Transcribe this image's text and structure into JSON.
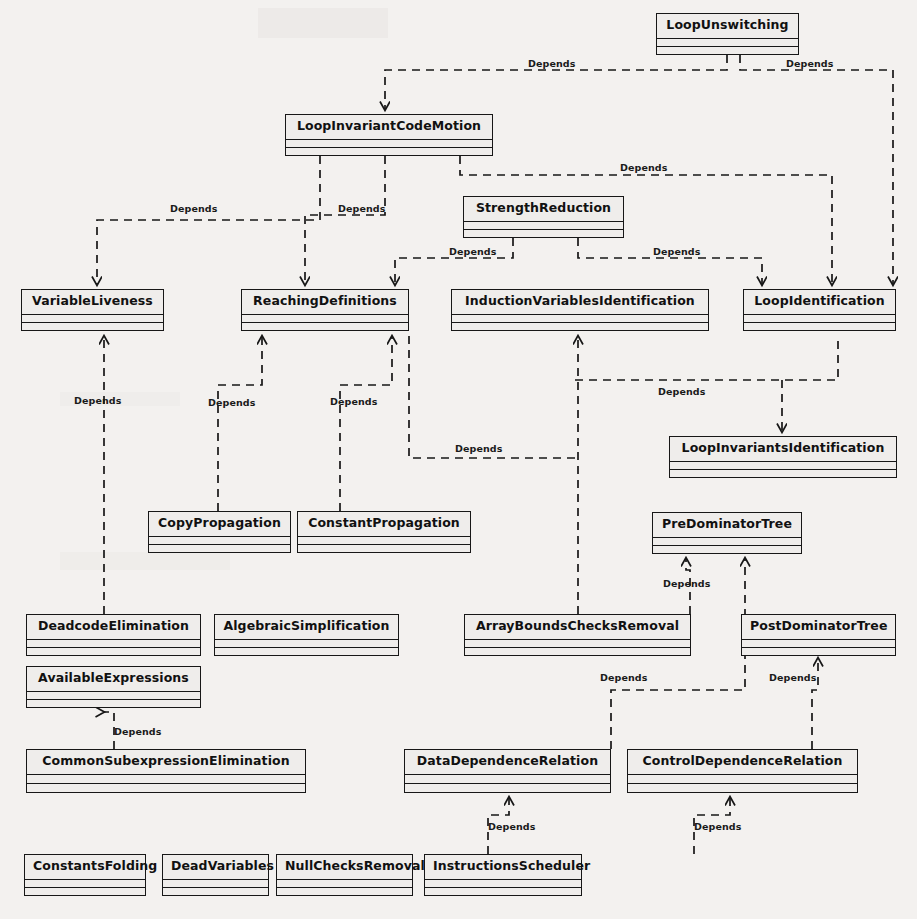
{
  "diagram": {
    "kind": "uml-class-dependency-diagram",
    "stereotype_label": "Depends",
    "colors": {
      "page_background": "#f3f1ef",
      "box_fill": "#efedeb",
      "line": "#171717",
      "text": "#111111"
    }
  },
  "classes": [
    {
      "id": "loop-unswitching",
      "name": "LoopUnswitching",
      "x": 656,
      "y": 13,
      "w": 143,
      "h": 42
    },
    {
      "id": "loop-invariant-code-motion",
      "name": "LoopInvariantCodeMotion",
      "x": 285,
      "y": 114,
      "w": 208,
      "h": 42
    },
    {
      "id": "strength-reduction",
      "name": "StrengthReduction",
      "x": 463,
      "y": 196,
      "w": 161,
      "h": 42
    },
    {
      "id": "variable-liveness",
      "name": "VariableLiveness",
      "x": 21,
      "y": 289,
      "w": 143,
      "h": 42
    },
    {
      "id": "reaching-definitions",
      "name": "ReachingDefinitions",
      "x": 241,
      "y": 289,
      "w": 168,
      "h": 42
    },
    {
      "id": "induction-variables-identification",
      "name": "InductionVariablesIdentification",
      "x": 451,
      "y": 289,
      "w": 258,
      "h": 42
    },
    {
      "id": "loop-identification",
      "name": "LoopIdentification",
      "x": 743,
      "y": 289,
      "w": 153,
      "h": 42
    },
    {
      "id": "loop-invariants-identification",
      "name": "LoopInvariantsIdentification",
      "x": 669,
      "y": 436,
      "w": 228,
      "h": 42
    },
    {
      "id": "copy-propagation",
      "name": "CopyPropagation",
      "x": 148,
      "y": 511,
      "w": 143,
      "h": 42
    },
    {
      "id": "constant-propagation",
      "name": "ConstantPropagation",
      "x": 297,
      "y": 511,
      "w": 174,
      "h": 42
    },
    {
      "id": "pre-dominator-tree",
      "name": "PreDominatorTree",
      "x": 652,
      "y": 512,
      "w": 150,
      "h": 42
    },
    {
      "id": "deadcode-elimination",
      "name": "DeadcodeElimination",
      "x": 26,
      "y": 614,
      "w": 175,
      "h": 42
    },
    {
      "id": "algebraic-simplification",
      "name": "AlgebraicSimplification",
      "x": 214,
      "y": 614,
      "w": 185,
      "h": 42
    },
    {
      "id": "array-bounds-checks-removal",
      "name": "ArrayBoundsChecksRemoval",
      "x": 464,
      "y": 614,
      "w": 227,
      "h": 42
    },
    {
      "id": "post-dominator-tree",
      "name": "PostDominatorTree",
      "x": 741,
      "y": 614,
      "w": 155,
      "h": 42
    },
    {
      "id": "available-expressions",
      "name": "AvailableExpressions",
      "x": 26,
      "y": 666,
      "w": 175,
      "h": 42
    },
    {
      "id": "common-subexpression-elimination",
      "name": "CommonSubexpressionElimination",
      "x": 26,
      "y": 749,
      "w": 280,
      "h": 44
    },
    {
      "id": "data-dependence-relation",
      "name": "DataDependenceRelation",
      "x": 404,
      "y": 749,
      "w": 207,
      "h": 44
    },
    {
      "id": "control-dependence-relation",
      "name": "ControlDependenceRelation",
      "x": 627,
      "y": 749,
      "w": 231,
      "h": 44
    },
    {
      "id": "constants-folding",
      "name": "ConstantsFolding",
      "x": 24,
      "y": 854,
      "w": 122,
      "h": 42
    },
    {
      "id": "dead-variables",
      "name": "DeadVariables",
      "x": 162,
      "y": 854,
      "w": 107,
      "h": 42
    },
    {
      "id": "null-checks-removal",
      "name": "NullChecksRemoval",
      "x": 276,
      "y": 854,
      "w": 137,
      "h": 42
    },
    {
      "id": "instructions-scheduler",
      "name": "InstructionsScheduler",
      "x": 424,
      "y": 854,
      "w": 158,
      "h": 42
    }
  ],
  "dependencies": [
    {
      "from": "loop-unswitching",
      "to": "loop-invariant-code-motion",
      "label": "Depends",
      "label_x": 528,
      "label_y": 58
    },
    {
      "from": "loop-unswitching",
      "to": "loop-identification",
      "label": "Depends",
      "label_x": 786,
      "label_y": 58
    },
    {
      "from": "loop-invariant-code-motion",
      "to": "variable-liveness",
      "label": "Depends",
      "label_x": 170,
      "label_y": 203
    },
    {
      "from": "loop-invariant-code-motion",
      "to": "reaching-definitions",
      "label": "Depends",
      "label_x": 338,
      "label_y": 203
    },
    {
      "from": "loop-invariant-code-motion",
      "to": "loop-identification",
      "label": "Depends",
      "label_x": 620,
      "label_y": 162
    },
    {
      "from": "strength-reduction",
      "to": "reaching-definitions",
      "label": "Depends",
      "label_x": 449,
      "label_y": 246
    },
    {
      "from": "strength-reduction",
      "to": "loop-identification",
      "label": "Depends",
      "label_x": 653,
      "label_y": 246
    },
    {
      "from": "copy-propagation",
      "to": "reaching-definitions",
      "label": "Depends",
      "label_x": 208,
      "label_y": 397
    },
    {
      "from": "constant-propagation",
      "to": "reaching-definitions",
      "label": "Depends",
      "label_x": 330,
      "label_y": 396
    },
    {
      "from": "deadcode-elimination",
      "to": "variable-liveness",
      "label": "Depends",
      "label_x": 74,
      "label_y": 395
    },
    {
      "from": "array-bounds-checks-removal",
      "to": "induction-variables-identification",
      "label": "Depends",
      "label_x": 455,
      "label_y": 443
    },
    {
      "from": "loop-invariants-identification",
      "to": "loop-identification",
      "label": "Depends",
      "label_x": 658,
      "label_y": 386
    },
    {
      "from": "array-bounds-checks-removal",
      "to": "pre-dominator-tree",
      "label": "Depends",
      "label_x": 663,
      "label_y": 578
    },
    {
      "from": "data-dependence-relation",
      "to": "pre-dominator-tree",
      "label": "Depends",
      "label_x": 600,
      "label_y": 672
    },
    {
      "from": "control-dependence-relation",
      "to": "post-dominator-tree",
      "label": "Depends",
      "label_x": 769,
      "label_y": 672
    },
    {
      "from": "common-subexpression-elimination",
      "to": "available-expressions",
      "label": "Depends",
      "label_x": 114,
      "label_y": 726
    },
    {
      "from": "instructions-scheduler",
      "to": "data-dependence-relation",
      "label": "Depends",
      "label_x": 488,
      "label_y": 821
    },
    {
      "from": "instructions-scheduler",
      "to": "control-dependence-relation",
      "label": "Depends",
      "label_x": 694,
      "label_y": 821
    }
  ]
}
